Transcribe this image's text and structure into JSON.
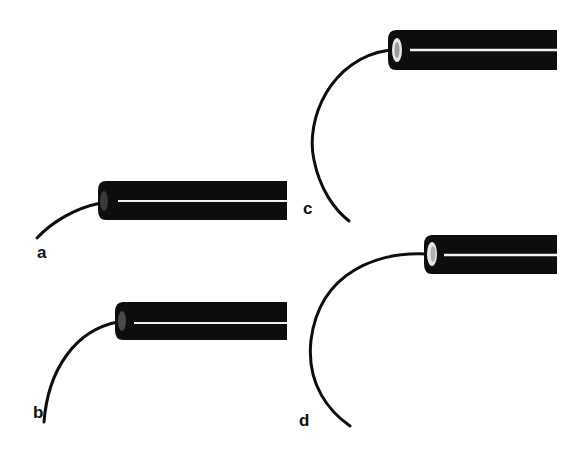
{
  "figure": {
    "colors": {
      "body": "#0d0d0d",
      "highlight": "#f2f2f2",
      "background": "#ffffff"
    },
    "panels": [
      {
        "id": "a",
        "label": "a"
      },
      {
        "id": "b",
        "label": "b"
      },
      {
        "id": "c",
        "label": "c"
      },
      {
        "id": "d",
        "label": "d"
      }
    ]
  }
}
